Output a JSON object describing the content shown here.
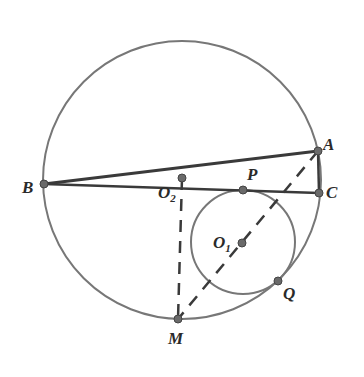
{
  "figure": {
    "type": "geometry",
    "colors": {
      "circle_stroke": "#777777",
      "line_stroke": "#3a3a3a",
      "point_fill": "#6a6a6a",
      "label": "#2a2a2a"
    },
    "circles": [
      {
        "name": "big-circle",
        "cx": 182,
        "cy": 180,
        "r": 139
      },
      {
        "name": "small-circle-O1",
        "cx": 243,
        "cy": 242,
        "r": 52
      }
    ],
    "segments_solid": [
      {
        "name": "segment-BA",
        "from": "B",
        "to": "A"
      },
      {
        "name": "segment-BC",
        "from": "B",
        "to": "C"
      },
      {
        "name": "segment-AC",
        "from": "A",
        "to": "C"
      }
    ],
    "segments_dashed": [
      {
        "name": "segment-AM",
        "from": "A",
        "to": "M"
      },
      {
        "name": "segment-O2M",
        "from": "O2",
        "to": "M"
      }
    ],
    "points": {
      "A": {
        "x": 318,
        "y": 151
      },
      "B": {
        "x": 44,
        "y": 184
      },
      "C": {
        "x": 319,
        "y": 193
      },
      "P": {
        "x": 243,
        "y": 190
      },
      "O1": {
        "x": 242,
        "y": 243
      },
      "O2": {
        "x": 182,
        "y": 178
      },
      "Q": {
        "x": 278,
        "y": 281
      },
      "M": {
        "x": 178,
        "y": 319
      }
    },
    "labels": {
      "A": {
        "text": "A",
        "x": 323,
        "y": 150
      },
      "B": {
        "text": "B",
        "x": 22,
        "y": 193
      },
      "C": {
        "text": "C",
        "x": 326,
        "y": 198
      },
      "P": {
        "text": "P",
        "x": 247,
        "y": 180
      },
      "O1": {
        "text": "O",
        "sub": "1",
        "x": 213,
        "y": 248
      },
      "O2": {
        "text": "O",
        "sub": "2",
        "x": 158,
        "y": 198
      },
      "Q": {
        "text": "Q",
        "x": 283,
        "y": 299
      },
      "M": {
        "text": "M",
        "x": 168,
        "y": 344
      }
    }
  }
}
